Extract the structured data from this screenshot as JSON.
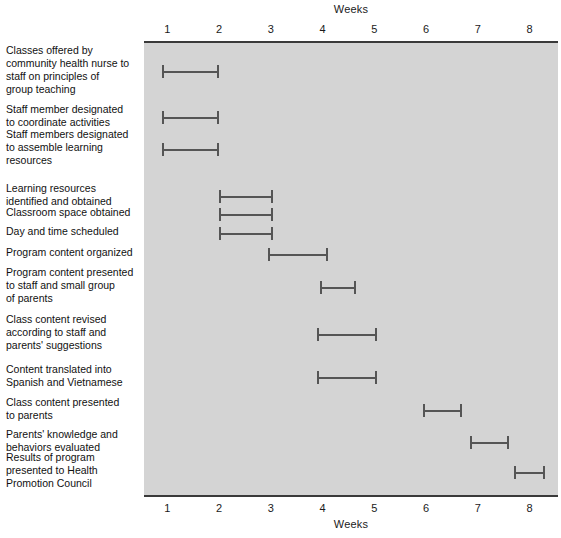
{
  "chart_data": {
    "type": "bar",
    "subtype": "gantt",
    "title": "Weeks",
    "xlabel": "Weeks",
    "xlabel_top": "Weeks",
    "xlabel_bottom": "Weeks",
    "ylabel": "",
    "xlim": [
      0.55,
      8.55
    ],
    "xticks": [
      1,
      2,
      3,
      4,
      5,
      6,
      7,
      8
    ],
    "xticklabels": [
      "1",
      "2",
      "3",
      "4",
      "5",
      "6",
      "7",
      "8"
    ],
    "grid": false,
    "legend": null,
    "plot_background": "#d4d4d4",
    "bar_color": "#555555",
    "categories": [
      "Classes offered by community health nurse to staff on principles of group teaching",
      "Staff member designated to coordinate activities",
      "Staff members designated to assemble learning resources",
      "Learning resources identified and obtained",
      "Classroom space obtained",
      "Day and time scheduled",
      "Program content organized",
      "Program content presented to staff and small group of parents",
      "Class content revised according to staff and parents' suggestions",
      "Content translated into Spanish and Vietnamese",
      "Class content presented to parents",
      "Parents' knowledge and behaviors evaluated",
      "Results of program presented to Health Promotion Council"
    ],
    "tasks": [
      {
        "label": "Classes offered by community health nurse to staff on principles of group teaching",
        "label_lines": [
          "Classes offered by",
          "community health nurse to",
          "staff on principles of",
          "group teaching"
        ],
        "start_week": 0.9,
        "end_week": 2.0
      },
      {
        "label": "Staff member designated to coordinate activities",
        "label_lines": [
          "Staff member designated",
          "to coordinate activities"
        ],
        "start_week": 0.9,
        "end_week": 2.0
      },
      {
        "label": "Staff members designated to assemble learning resources",
        "label_lines": [
          "Staff members designated",
          "to assemble learning",
          "resources"
        ],
        "start_week": 0.9,
        "end_week": 2.0
      },
      {
        "label": "Learning resources identified and obtained",
        "label_lines": [
          "Learning resources",
          "identified and obtained"
        ],
        "start_week": 2.0,
        "end_week": 3.05
      },
      {
        "label": "Classroom space obtained",
        "label_lines": [
          "Classroom space obtained"
        ],
        "start_week": 2.0,
        "end_week": 3.05
      },
      {
        "label": "Day and time scheduled",
        "label_lines": [
          "Day and time scheduled"
        ],
        "start_week": 2.0,
        "end_week": 3.05
      },
      {
        "label": "Program content organized",
        "label_lines": [
          "Program content organized"
        ],
        "start_week": 2.95,
        "end_week": 4.1
      },
      {
        "label": "Program content presented to staff and small group of parents",
        "label_lines": [
          "Program content presented",
          "to staff and small group",
          "of parents"
        ],
        "start_week": 3.95,
        "end_week": 4.65
      },
      {
        "label": "Class content revised according to staff and parents' suggestions",
        "label_lines": [
          "Class content revised",
          "according to staff and",
          "parents' suggestions"
        ],
        "start_week": 3.9,
        "end_week": 5.05
      },
      {
        "label": "Content translated into Spanish and Vietnamese",
        "label_lines": [
          "Content translated into",
          "Spanish and Vietnamese"
        ],
        "start_week": 3.9,
        "end_week": 5.05
      },
      {
        "label": "Class content presented to parents",
        "label_lines": [
          "Class content presented",
          "to parents"
        ],
        "start_week": 5.95,
        "end_week": 6.7
      },
      {
        "label": "Parents' knowledge and behaviors evaluated",
        "label_lines": [
          "Parents' knowledge and",
          "behaviors evaluated"
        ],
        "start_week": 6.85,
        "end_week": 7.6
      },
      {
        "label": "Results of program presented to Health Promotion Council",
        "label_lines": [
          "Results of program",
          "presented to Health",
          "Promotion Council"
        ],
        "start_week": 7.7,
        "end_week": 8.3
      }
    ]
  },
  "chart": {
    "title_top": "Weeks",
    "title_bottom": "Weeks"
  }
}
